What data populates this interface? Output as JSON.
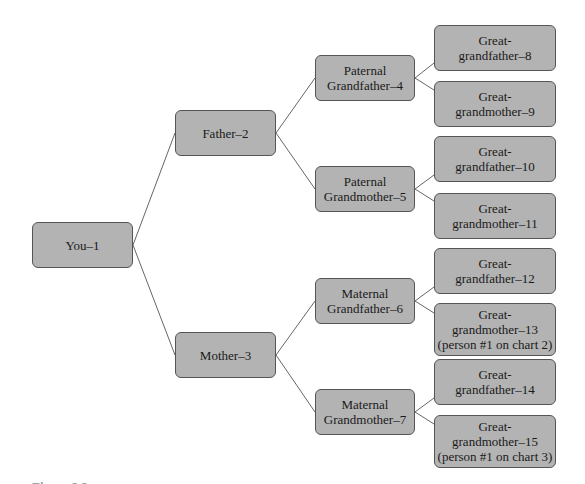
{
  "diagram": {
    "type": "pedigree-chart",
    "line_color": "#666666",
    "box_fill": "#b3b3b3",
    "box_border": "#555555",
    "nodes": {
      "n1": {
        "lines": [
          "You–1"
        ]
      },
      "n2": {
        "lines": [
          "Father–2"
        ]
      },
      "n3": {
        "lines": [
          "Mother–3"
        ]
      },
      "n4": {
        "lines": [
          "Paternal",
          "Grandfather–4"
        ]
      },
      "n5": {
        "lines": [
          "Paternal",
          "Grandmother–5"
        ]
      },
      "n6": {
        "lines": [
          "Maternal",
          "Grandfather–6"
        ]
      },
      "n7": {
        "lines": [
          "Maternal",
          "Grandmother–7"
        ]
      },
      "n8": {
        "lines": [
          "Great-",
          "grandfather–8"
        ]
      },
      "n9": {
        "lines": [
          "Great-",
          "grandmother–9"
        ]
      },
      "n10": {
        "lines": [
          "Great-",
          "grandfather–10"
        ]
      },
      "n11": {
        "lines": [
          "Great-",
          "grandmother–11"
        ]
      },
      "n12": {
        "lines": [
          "Great-",
          "grandfather–12"
        ]
      },
      "n13": {
        "lines": [
          "Great-",
          "grandmother–13",
          "(person #1 on chart 2)"
        ]
      },
      "n14": {
        "lines": [
          "Great-",
          "grandfather–14"
        ]
      },
      "n15": {
        "lines": [
          "Great-",
          "grandmother–15",
          "(person #1 on chart 3)"
        ]
      }
    },
    "edges": [
      [
        "n1",
        "n2"
      ],
      [
        "n1",
        "n3"
      ],
      [
        "n2",
        "n4"
      ],
      [
        "n2",
        "n5"
      ],
      [
        "n3",
        "n6"
      ],
      [
        "n3",
        "n7"
      ],
      [
        "n4",
        "n8"
      ],
      [
        "n4",
        "n9"
      ],
      [
        "n5",
        "n10"
      ],
      [
        "n5",
        "n11"
      ],
      [
        "n6",
        "n12"
      ],
      [
        "n6",
        "n13"
      ],
      [
        "n7",
        "n14"
      ],
      [
        "n7",
        "n15"
      ]
    ]
  },
  "caption": {
    "text": "Figure 2.2"
  }
}
